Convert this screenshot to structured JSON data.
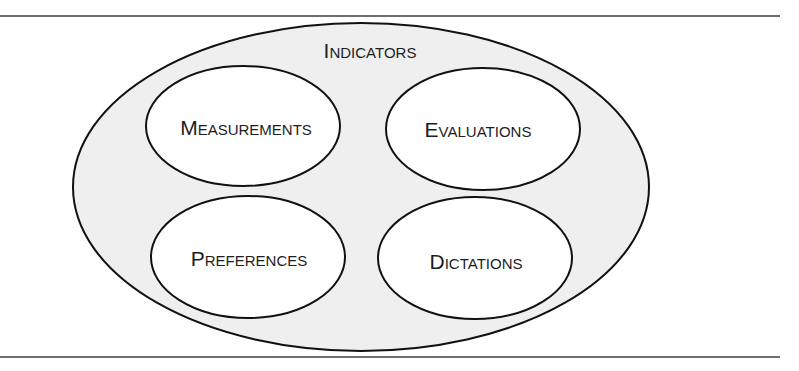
{
  "diagram": {
    "outer": {
      "label": "Indicators",
      "fill": "#efefef",
      "stroke": "#111111"
    },
    "inner": [
      {
        "id": "measurements",
        "label": "Measurements",
        "fill": "#ffffff"
      },
      {
        "id": "evaluations",
        "label": "Evaluations",
        "fill": "#ffffff"
      },
      {
        "id": "preferences",
        "label": "Preferences",
        "fill": "#ffffff"
      },
      {
        "id": "dictations",
        "label": "Dictations",
        "fill": "#ffffff"
      }
    ]
  }
}
